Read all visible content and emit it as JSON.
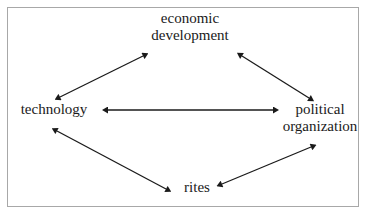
{
  "diagram": {
    "type": "cycle-diagram",
    "border_color": "#a8a8a8",
    "background_color": "#ffffff",
    "text_color": "#1a1a1a",
    "arrow_color": "#1a1a1a",
    "nodes": [
      {
        "id": "economic-development",
        "label": "economic\ndevelopment",
        "line1": "economic",
        "line2": "development",
        "position": "top"
      },
      {
        "id": "technology",
        "label": "technology",
        "line1": "technology",
        "line2": "",
        "position": "left"
      },
      {
        "id": "political-organization",
        "label": "political\norganization",
        "line1": "political",
        "line2": "organization",
        "position": "right"
      },
      {
        "id": "rites",
        "label": "rites",
        "line1": "rites",
        "line2": "",
        "position": "bottom"
      }
    ],
    "edges": [
      {
        "id": "technology-economic-development",
        "from": "technology",
        "to": "economic-development",
        "direction": "bidirectional"
      },
      {
        "id": "economic-development-political-organization",
        "from": "economic-development",
        "to": "political-organization",
        "direction": "bidirectional"
      },
      {
        "id": "technology-political-organization",
        "from": "technology",
        "to": "political-organization",
        "direction": "bidirectional"
      },
      {
        "id": "technology-rites",
        "from": "technology",
        "to": "rites",
        "direction": "bidirectional"
      },
      {
        "id": "rites-political-organization",
        "from": "rites",
        "to": "political-organization",
        "direction": "bidirectional"
      }
    ]
  }
}
